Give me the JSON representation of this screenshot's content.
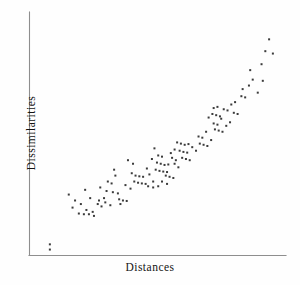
{
  "chart_data": {
    "type": "scatter",
    "title": "",
    "xlabel": "Distances",
    "ylabel": "Dissimilarities",
    "grid": false,
    "legend": null,
    "xticks": [],
    "yticks": [],
    "xlim": [
      0,
      100
    ],
    "ylim": [
      0,
      100
    ],
    "marker": "small-square-dot",
    "marker_color": "#3b3b3b",
    "marker_size_px": 2,
    "n_points": 120,
    "points": [
      [
        5.5,
        4.5
      ],
      [
        5.5,
        2.3
      ],
      [
        13.0,
        25.5
      ],
      [
        15.5,
        23.0
      ],
      [
        17.8,
        21.5
      ],
      [
        14.5,
        20.0
      ],
      [
        19.5,
        27.5
      ],
      [
        21.5,
        24.0
      ],
      [
        20.0,
        19.0
      ],
      [
        22.5,
        18.2
      ],
      [
        17.0,
        17.5
      ],
      [
        19.0,
        17.2
      ],
      [
        21.0,
        17.2
      ],
      [
        23.0,
        16.5
      ],
      [
        24.5,
        21.5
      ],
      [
        25.5,
        28.5
      ],
      [
        27.0,
        24.0
      ],
      [
        26.0,
        20.5
      ],
      [
        28.5,
        31.0
      ],
      [
        30.0,
        30.2
      ],
      [
        31.5,
        33.5
      ],
      [
        28.0,
        27.0
      ],
      [
        30.5,
        26.5
      ],
      [
        32.5,
        26.0
      ],
      [
        25.0,
        23.0
      ],
      [
        27.5,
        22.2
      ],
      [
        33.0,
        23.5
      ],
      [
        34.5,
        23.0
      ],
      [
        36.0,
        22.8
      ],
      [
        31.0,
        36.0
      ],
      [
        35.5,
        29.5
      ],
      [
        37.5,
        28.0
      ],
      [
        33.5,
        21.5
      ],
      [
        29.5,
        21.0
      ],
      [
        38.0,
        34.5
      ],
      [
        39.5,
        33.5
      ],
      [
        41.0,
        33.2
      ],
      [
        42.5,
        33.0
      ],
      [
        39.0,
        31.0
      ],
      [
        40.5,
        30.5
      ],
      [
        42.0,
        30.2
      ],
      [
        43.5,
        30.0
      ],
      [
        45.0,
        34.0
      ],
      [
        44.0,
        36.5
      ],
      [
        38.5,
        38.5
      ],
      [
        36.5,
        40.0
      ],
      [
        46.5,
        31.0
      ],
      [
        44.5,
        29.0
      ],
      [
        47.0,
        45.0
      ],
      [
        48.5,
        42.0
      ],
      [
        50.0,
        41.5
      ],
      [
        46.0,
        40.5
      ],
      [
        48.0,
        39.0
      ],
      [
        49.5,
        38.5
      ],
      [
        51.0,
        38.0
      ],
      [
        52.5,
        38.2
      ],
      [
        47.5,
        36.0
      ],
      [
        49.0,
        35.5
      ],
      [
        50.5,
        35.2
      ],
      [
        52.0,
        35.0
      ],
      [
        53.5,
        43.0
      ],
      [
        55.0,
        44.5
      ],
      [
        54.0,
        41.0
      ],
      [
        55.5,
        40.0
      ],
      [
        51.5,
        33.5
      ],
      [
        53.0,
        33.0
      ],
      [
        54.5,
        32.5
      ],
      [
        50.0,
        31.0
      ],
      [
        52.0,
        30.0
      ],
      [
        48.5,
        29.0
      ],
      [
        46.5,
        28.5
      ],
      [
        56.0,
        47.5
      ],
      [
        57.5,
        47.0
      ],
      [
        59.0,
        46.5
      ],
      [
        60.5,
        46.8
      ],
      [
        57.0,
        44.0
      ],
      [
        58.5,
        43.5
      ],
      [
        60.0,
        43.2
      ],
      [
        62.0,
        45.5
      ],
      [
        63.5,
        44.0
      ],
      [
        58.0,
        41.0
      ],
      [
        59.5,
        40.5
      ],
      [
        61.0,
        40.0
      ],
      [
        55.0,
        38.5
      ],
      [
        56.5,
        37.0
      ],
      [
        64.5,
        50.0
      ],
      [
        66.0,
        49.5
      ],
      [
        67.5,
        52.0
      ],
      [
        65.0,
        47.0
      ],
      [
        66.5,
        46.5
      ],
      [
        68.0,
        46.0
      ],
      [
        69.5,
        48.5
      ],
      [
        70.5,
        55.5
      ],
      [
        72.0,
        55.0
      ],
      [
        73.5,
        57.5
      ],
      [
        71.0,
        53.0
      ],
      [
        72.5,
        52.5
      ],
      [
        74.0,
        52.0
      ],
      [
        75.5,
        54.5
      ],
      [
        77.0,
        56.0
      ],
      [
        70.0,
        59.5
      ],
      [
        71.5,
        59.0
      ],
      [
        73.0,
        58.5
      ],
      [
        68.5,
        58.0
      ],
      [
        74.5,
        61.5
      ],
      [
        76.0,
        61.0
      ],
      [
        72.0,
        62.5
      ],
      [
        70.5,
        62.0
      ],
      [
        78.5,
        60.0
      ],
      [
        80.0,
        59.5
      ],
      [
        77.5,
        63.5
      ],
      [
        79.0,
        64.5
      ],
      [
        81.5,
        67.0
      ],
      [
        83.0,
        66.5
      ],
      [
        82.0,
        70.0
      ],
      [
        84.5,
        71.5
      ],
      [
        86.0,
        74.0
      ],
      [
        88.0,
        68.5
      ],
      [
        85.0,
        78.0
      ],
      [
        89.5,
        80.5
      ],
      [
        91.0,
        86.0
      ],
      [
        92.5,
        91.0
      ],
      [
        94.0,
        85.0
      ],
      [
        90.0,
        73.5
      ]
    ]
  },
  "axes": {
    "x_axis_name": "x-axis",
    "y_axis_name": "y-axis",
    "axis_color": "#8e8e8e"
  },
  "labels": {
    "x": "Distances",
    "y": "Dissimilarities"
  }
}
